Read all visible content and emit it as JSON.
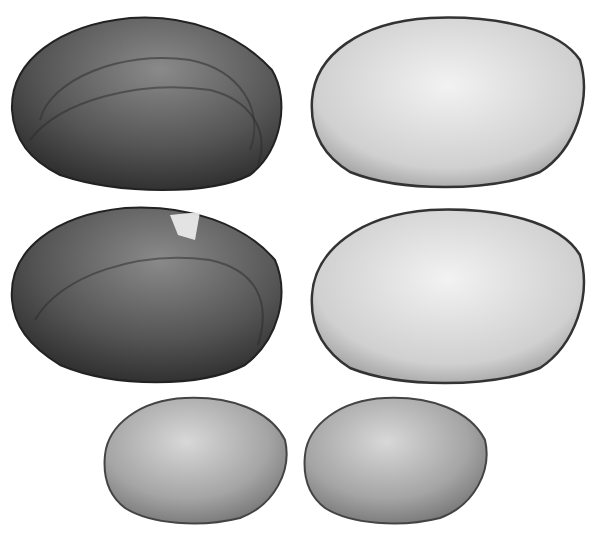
{
  "figure": {
    "shells": [
      {
        "row": 1,
        "side": "left",
        "view": "exterior",
        "tone": "#4a4a4a"
      },
      {
        "row": 1,
        "side": "right",
        "view": "interior",
        "tone": "#cfcfcf"
      },
      {
        "row": 2,
        "side": "left",
        "view": "exterior",
        "tone": "#505050"
      },
      {
        "row": 2,
        "side": "right",
        "view": "interior",
        "tone": "#d2d2d2"
      },
      {
        "row": 3,
        "side": "left",
        "view": "interior",
        "tone": "#a8a8a8"
      },
      {
        "row": 3,
        "side": "right",
        "view": "interior",
        "tone": "#a0a0a0"
      }
    ]
  }
}
